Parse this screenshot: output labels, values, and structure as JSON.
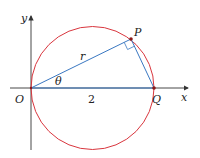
{
  "diagram": {
    "labels": {
      "y_axis": "y",
      "x_axis": "x",
      "origin": "O",
      "point_p": "P",
      "point_q": "Q",
      "radius": "r",
      "angle": "θ",
      "diameter_length": "2"
    },
    "colors": {
      "circle": "#d9363e",
      "segments": "#3a78c2",
      "axes": "#333333",
      "points": "#8b1a1a"
    }
  }
}
